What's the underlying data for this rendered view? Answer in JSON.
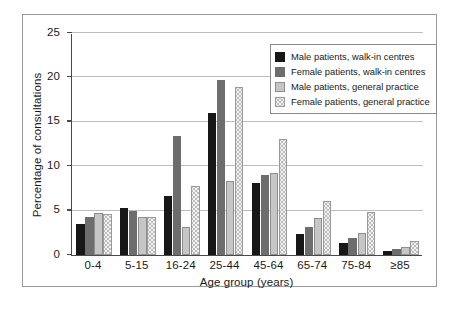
{
  "chart_data": {
    "type": "bar",
    "title": "",
    "xlabel": "Age group (years)",
    "ylabel": "Percentage of consultations",
    "categories": [
      "0-4",
      "5-15",
      "16-24",
      "25-44",
      "45-64",
      "65-74",
      "75-84",
      "≥85"
    ],
    "ylim": [
      0,
      25
    ],
    "yticks": [
      0,
      5,
      10,
      15,
      20,
      25
    ],
    "ytick_labels": [
      "0",
      "5",
      "10",
      "15",
      "20",
      "25"
    ],
    "grid": true,
    "legend_position": "top-right",
    "series": [
      {
        "name": "Male patients, walk-in centres",
        "color": "#171717",
        "values": [
          3.5,
          5.3,
          6.7,
          16.0,
          8.1,
          2.4,
          1.3,
          0.5
        ]
      },
      {
        "name": "Female patients, walk-in centres",
        "color": "#6d6d6d",
        "values": [
          4.3,
          5.0,
          13.4,
          19.7,
          9.0,
          3.2,
          1.9,
          0.7
        ]
      },
      {
        "name": "Male patients, general practice",
        "color": "#c6c6c6",
        "values": [
          4.7,
          4.3,
          3.1,
          8.3,
          9.2,
          4.2,
          2.5,
          0.9
        ]
      },
      {
        "name": "Female patients, general practice",
        "color": "#f2f2f2",
        "values": [
          4.6,
          4.3,
          7.8,
          18.9,
          13.1,
          6.1,
          4.8,
          1.6
        ]
      }
    ]
  }
}
